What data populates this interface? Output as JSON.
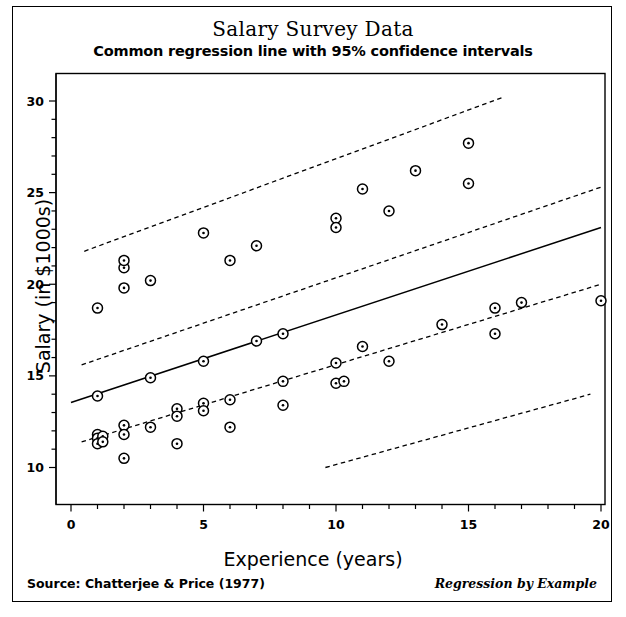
{
  "figure": {
    "title": "Salary Survey Data",
    "subtitle": "Common regression line with 95% confidence intervals",
    "source_note": "Source: Chatterjee & Price (1977)",
    "book_note": "Regression by Example"
  },
  "chart_data": {
    "type": "scatter",
    "title": "Salary Survey Data",
    "subtitle": "Common regression line with 95% confidence intervals",
    "xlabel": "Experience (years)",
    "ylabel": "Salary (in $1000s)",
    "xlim": [
      0,
      20
    ],
    "ylim": [
      9.1,
      31.0
    ],
    "grid": false,
    "legend": "none",
    "x_ticks_major": [
      0,
      5,
      10,
      15,
      20
    ],
    "x_ticks_minor_step": 1,
    "y_ticks_major": [
      10,
      15,
      20,
      25,
      30
    ],
    "y_ticks_minor_step": 1,
    "marker": "circle-with-center-dot",
    "points": [
      {
        "x": 1.0,
        "y": 18.7
      },
      {
        "x": 1.0,
        "y": 13.9
      },
      {
        "x": 1.0,
        "y": 11.8
      },
      {
        "x": 1.0,
        "y": 11.6
      },
      {
        "x": 1.0,
        "y": 11.3
      },
      {
        "x": 1.2,
        "y": 11.7
      },
      {
        "x": 1.2,
        "y": 11.4
      },
      {
        "x": 2.0,
        "y": 20.9
      },
      {
        "x": 2.0,
        "y": 21.3
      },
      {
        "x": 2.0,
        "y": 19.8
      },
      {
        "x": 2.0,
        "y": 12.3
      },
      {
        "x": 2.0,
        "y": 11.8
      },
      {
        "x": 2.0,
        "y": 10.5
      },
      {
        "x": 3.0,
        "y": 20.2
      },
      {
        "x": 3.0,
        "y": 14.9
      },
      {
        "x": 3.0,
        "y": 12.2
      },
      {
        "x": 4.0,
        "y": 13.2
      },
      {
        "x": 4.0,
        "y": 12.8
      },
      {
        "x": 4.0,
        "y": 11.3
      },
      {
        "x": 5.0,
        "y": 22.8
      },
      {
        "x": 5.0,
        "y": 15.8
      },
      {
        "x": 5.0,
        "y": 13.5
      },
      {
        "x": 5.0,
        "y": 13.1
      },
      {
        "x": 6.0,
        "y": 21.3
      },
      {
        "x": 6.0,
        "y": 13.7
      },
      {
        "x": 6.0,
        "y": 12.2
      },
      {
        "x": 7.0,
        "y": 22.1
      },
      {
        "x": 7.0,
        "y": 16.9
      },
      {
        "x": 8.0,
        "y": 17.3
      },
      {
        "x": 8.0,
        "y": 14.7
      },
      {
        "x": 8.0,
        "y": 13.4
      },
      {
        "x": 10.0,
        "y": 23.6
      },
      {
        "x": 10.0,
        "y": 23.1
      },
      {
        "x": 10.0,
        "y": 15.7
      },
      {
        "x": 10.0,
        "y": 14.6
      },
      {
        "x": 10.3,
        "y": 14.7
      },
      {
        "x": 11.0,
        "y": 25.2
      },
      {
        "x": 11.0,
        "y": 16.6
      },
      {
        "x": 12.0,
        "y": 24.0
      },
      {
        "x": 12.0,
        "y": 15.8
      },
      {
        "x": 13.0,
        "y": 26.2
      },
      {
        "x": 14.0,
        "y": 17.8
      },
      {
        "x": 15.0,
        "y": 27.7
      },
      {
        "x": 15.0,
        "y": 25.5
      },
      {
        "x": 16.0,
        "y": 18.7
      },
      {
        "x": 16.0,
        "y": 17.3
      },
      {
        "x": 17.0,
        "y": 19.0
      },
      {
        "x": 20.0,
        "y": 19.1
      }
    ],
    "regression_line": {
      "style": "solid",
      "x": [
        0.0,
        20.0
      ],
      "y": [
        13.55,
        23.1
      ]
    },
    "confidence_bands": [
      {
        "name": "upper-outer",
        "style": "dashed",
        "x": [
          0.5,
          16.3
        ],
        "y": [
          21.8,
          30.2
        ]
      },
      {
        "name": "upper-inner",
        "style": "dashed",
        "x": [
          0.4,
          20.0
        ],
        "y": [
          15.6,
          25.3
        ]
      },
      {
        "name": "lower-inner",
        "style": "dashed",
        "x": [
          0.4,
          20.0
        ],
        "y": [
          11.4,
          20.0
        ]
      },
      {
        "name": "lower-outer",
        "style": "dashed",
        "x": [
          9.6,
          19.6
        ],
        "y": [
          10.0,
          14.0
        ]
      }
    ]
  }
}
